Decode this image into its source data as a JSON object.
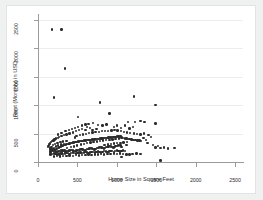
{
  "chart_data": {
    "type": "scatter",
    "title": "",
    "xlabel": "Home Size in Square Feet",
    "ylabel": "Rent (Monthly) in USD",
    "xlim": [
      0,
      2600
    ],
    "ylim": [
      0,
      2600
    ],
    "xticks": [
      0,
      500,
      1000,
      1500,
      2000,
      2500
    ],
    "yticks": [
      0,
      500,
      1000,
      1500,
      2000,
      2500
    ],
    "xtick_labels": [
      "0",
      "500",
      "1000",
      "1500",
      "2000",
      "2500"
    ],
    "ytick_labels": [
      "0",
      "500",
      "1000",
      "1500",
      "2000",
      "2500"
    ],
    "grid": "horizontal",
    "legend": "none",
    "marker": {
      "shape": "circle",
      "color": "#2c2c2c",
      "size": 2.4
    },
    "background": "#ffffff",
    "figure_background": "#eff0f0",
    "points": [
      [
        178,
        2330
      ],
      [
        300,
        2330
      ],
      [
        345,
        1640
      ],
      [
        205,
        1135
      ],
      [
        790,
        1045
      ],
      [
        1215,
        1150
      ],
      [
        1490,
        1000
      ],
      [
        505,
        790
      ],
      [
        905,
        850
      ],
      [
        1140,
        700
      ],
      [
        1230,
        700
      ],
      [
        1300,
        720
      ],
      [
        1350,
        705
      ],
      [
        1490,
        675
      ],
      [
        700,
        690
      ],
      [
        760,
        650
      ],
      [
        820,
        640
      ],
      [
        870,
        660
      ],
      [
        960,
        620
      ],
      [
        1000,
        640
      ],
      [
        1050,
        600
      ],
      [
        1100,
        640
      ],
      [
        1160,
        590
      ],
      [
        1205,
        610
      ],
      [
        620,
        620
      ],
      [
        660,
        600
      ],
      [
        560,
        580
      ],
      [
        600,
        560
      ],
      [
        520,
        560
      ],
      [
        480,
        540
      ],
      [
        440,
        520
      ],
      [
        400,
        500
      ],
      [
        360,
        480
      ],
      [
        330,
        470
      ],
      [
        300,
        455
      ],
      [
        270,
        440
      ],
      [
        250,
        420
      ],
      [
        230,
        410
      ],
      [
        210,
        395
      ],
      [
        195,
        380
      ],
      [
        180,
        370
      ],
      [
        165,
        350
      ],
      [
        155,
        335
      ],
      [
        145,
        320
      ],
      [
        140,
        300
      ],
      [
        135,
        285
      ],
      [
        130,
        265
      ],
      [
        150,
        250
      ],
      [
        160,
        240
      ],
      [
        175,
        230
      ],
      [
        190,
        225
      ],
      [
        205,
        220
      ],
      [
        220,
        215
      ],
      [
        235,
        230
      ],
      [
        250,
        245
      ],
      [
        265,
        255
      ],
      [
        280,
        265
      ],
      [
        295,
        275
      ],
      [
        310,
        285
      ],
      [
        325,
        295
      ],
      [
        340,
        300
      ],
      [
        355,
        310
      ],
      [
        370,
        315
      ],
      [
        385,
        320
      ],
      [
        400,
        325
      ],
      [
        415,
        330
      ],
      [
        430,
        335
      ],
      [
        445,
        340
      ],
      [
        460,
        345
      ],
      [
        475,
        350
      ],
      [
        490,
        355
      ],
      [
        505,
        360
      ],
      [
        520,
        360
      ],
      [
        535,
        365
      ],
      [
        550,
        370
      ],
      [
        565,
        372
      ],
      [
        580,
        375
      ],
      [
        595,
        378
      ],
      [
        610,
        380
      ],
      [
        625,
        382
      ],
      [
        640,
        385
      ],
      [
        655,
        388
      ],
      [
        670,
        390
      ],
      [
        685,
        392
      ],
      [
        700,
        395
      ],
      [
        715,
        398
      ],
      [
        730,
        400
      ],
      [
        745,
        402
      ],
      [
        760,
        405
      ],
      [
        775,
        408
      ],
      [
        790,
        410
      ],
      [
        805,
        412
      ],
      [
        820,
        415
      ],
      [
        835,
        418
      ],
      [
        850,
        420
      ],
      [
        865,
        422
      ],
      [
        880,
        425
      ],
      [
        895,
        428
      ],
      [
        910,
        430
      ],
      [
        925,
        432
      ],
      [
        940,
        435
      ],
      [
        955,
        438
      ],
      [
        970,
        440
      ],
      [
        985,
        442
      ],
      [
        1000,
        445
      ],
      [
        1015,
        448
      ],
      [
        1030,
        450
      ],
      [
        1045,
        452
      ],
      [
        1060,
        430
      ],
      [
        1080,
        420
      ],
      [
        1100,
        415
      ],
      [
        1120,
        410
      ],
      [
        1140,
        405
      ],
      [
        1160,
        400
      ],
      [
        1185,
        395
      ],
      [
        1210,
        390
      ],
      [
        1235,
        385
      ],
      [
        1260,
        380
      ],
      [
        1285,
        375
      ],
      [
        1310,
        370
      ],
      [
        1340,
        420
      ],
      [
        1370,
        390
      ],
      [
        1400,
        470
      ],
      [
        1430,
        440
      ],
      [
        1460,
        300
      ],
      [
        1490,
        255
      ],
      [
        1520,
        280
      ],
      [
        1555,
        250
      ],
      [
        1600,
        255
      ],
      [
        1650,
        240
      ],
      [
        1730,
        245
      ],
      [
        160,
        185
      ],
      [
        175,
        190
      ],
      [
        190,
        195
      ],
      [
        205,
        200
      ],
      [
        220,
        180
      ],
      [
        235,
        175
      ],
      [
        250,
        185
      ],
      [
        265,
        190
      ],
      [
        280,
        195
      ],
      [
        295,
        200
      ],
      [
        310,
        205
      ],
      [
        325,
        195
      ],
      [
        340,
        188
      ],
      [
        355,
        182
      ],
      [
        370,
        192
      ],
      [
        385,
        198
      ],
      [
        400,
        205
      ],
      [
        415,
        210
      ],
      [
        430,
        215
      ],
      [
        445,
        205
      ],
      [
        460,
        198
      ],
      [
        475,
        192
      ],
      [
        490,
        200
      ],
      [
        505,
        208
      ],
      [
        520,
        215
      ],
      [
        535,
        222
      ],
      [
        550,
        228
      ],
      [
        565,
        220
      ],
      [
        580,
        212
      ],
      [
        595,
        205
      ],
      [
        610,
        215
      ],
      [
        625,
        225
      ],
      [
        640,
        232
      ],
      [
        655,
        240
      ],
      [
        670,
        245
      ],
      [
        685,
        238
      ],
      [
        700,
        230
      ],
      [
        715,
        222
      ],
      [
        730,
        232
      ],
      [
        745,
        242
      ],
      [
        760,
        250
      ],
      [
        775,
        258
      ],
      [
        790,
        262
      ],
      [
        805,
        255
      ],
      [
        820,
        248
      ],
      [
        835,
        240
      ],
      [
        850,
        250
      ],
      [
        865,
        260
      ],
      [
        880,
        268
      ],
      [
        895,
        275
      ],
      [
        910,
        280
      ],
      [
        925,
        272
      ],
      [
        940,
        265
      ],
      [
        955,
        258
      ],
      [
        970,
        268
      ],
      [
        985,
        278
      ],
      [
        1000,
        285
      ],
      [
        1015,
        292
      ],
      [
        1030,
        298
      ],
      [
        1045,
        290
      ],
      [
        160,
        130
      ],
      [
        180,
        140
      ],
      [
        200,
        150
      ],
      [
        220,
        145
      ],
      [
        240,
        135
      ],
      [
        260,
        145
      ],
      [
        280,
        155
      ],
      [
        300,
        150
      ],
      [
        320,
        140
      ],
      [
        340,
        150
      ],
      [
        360,
        160
      ],
      [
        380,
        155
      ],
      [
        400,
        145
      ],
      [
        420,
        155
      ],
      [
        440,
        165
      ],
      [
        460,
        160
      ],
      [
        480,
        150
      ],
      [
        500,
        160
      ],
      [
        520,
        170
      ],
      [
        540,
        165
      ],
      [
        560,
        155
      ],
      [
        580,
        165
      ],
      [
        600,
        175
      ],
      [
        620,
        170
      ],
      [
        640,
        160
      ],
      [
        660,
        170
      ],
      [
        680,
        180
      ],
      [
        700,
        175
      ],
      [
        720,
        165
      ],
      [
        740,
        175
      ],
      [
        760,
        185
      ],
      [
        780,
        180
      ],
      [
        800,
        170
      ],
      [
        820,
        180
      ],
      [
        840,
        190
      ],
      [
        860,
        185
      ],
      [
        880,
        175
      ],
      [
        900,
        185
      ],
      [
        920,
        195
      ],
      [
        940,
        190
      ],
      [
        960,
        180
      ],
      [
        980,
        190
      ],
      [
        1000,
        200
      ],
      [
        1020,
        195
      ],
      [
        1040,
        185
      ],
      [
        1060,
        195
      ],
      [
        1080,
        200
      ],
      [
        1100,
        190
      ],
      [
        200,
        95
      ],
      [
        240,
        105
      ],
      [
        280,
        100
      ],
      [
        320,
        110
      ],
      [
        360,
        105
      ],
      [
        400,
        115
      ],
      [
        440,
        110
      ],
      [
        480,
        120
      ],
      [
        520,
        115
      ],
      [
        560,
        125
      ],
      [
        600,
        120
      ],
      [
        640,
        130
      ],
      [
        680,
        125
      ],
      [
        720,
        135
      ],
      [
        760,
        130
      ],
      [
        800,
        140
      ],
      [
        840,
        135
      ],
      [
        880,
        145
      ],
      [
        920,
        140
      ],
      [
        960,
        150
      ],
      [
        1000,
        145
      ],
      [
        1040,
        150
      ],
      [
        1080,
        140
      ],
      [
        1120,
        135
      ],
      [
        1160,
        130
      ],
      [
        1200,
        140
      ],
      [
        1250,
        150
      ],
      [
        1300,
        145
      ],
      [
        255,
        480
      ],
      [
        300,
        510
      ],
      [
        350,
        540
      ],
      [
        395,
        560
      ],
      [
        430,
        585
      ],
      [
        470,
        600
      ],
      [
        510,
        620
      ],
      [
        560,
        640
      ],
      [
        600,
        660
      ],
      [
        640,
        670
      ],
      [
        690,
        560
      ],
      [
        740,
        575
      ],
      [
        470,
        430
      ],
      [
        490,
        460
      ],
      [
        530,
        470
      ],
      [
        570,
        485
      ],
      [
        610,
        495
      ],
      [
        650,
        505
      ],
      [
        690,
        515
      ],
      [
        730,
        525
      ],
      [
        770,
        530
      ],
      [
        810,
        540
      ],
      [
        850,
        545
      ],
      [
        890,
        550
      ],
      [
        930,
        555
      ],
      [
        970,
        560
      ],
      [
        1010,
        555
      ],
      [
        1050,
        545
      ],
      [
        1090,
        530
      ],
      [
        1130,
        520
      ],
      [
        1170,
        510
      ],
      [
        1215,
        500
      ],
      [
        1255,
        490
      ],
      [
        1300,
        480
      ],
      [
        1345,
        500
      ],
      [
        1390,
        330
      ],
      [
        1060,
        85
      ],
      [
        1555,
        25
      ],
      [
        1060,
        265
      ],
      [
        1120,
        300
      ],
      [
        275,
        125
      ],
      [
        305,
        165
      ],
      [
        335,
        205
      ],
      [
        365,
        245
      ],
      [
        415,
        260
      ],
      [
        455,
        275
      ],
      [
        495,
        290
      ],
      [
        545,
        305
      ],
      [
        585,
        318
      ],
      [
        625,
        330
      ],
      [
        665,
        342
      ],
      [
        705,
        352
      ],
      [
        745,
        360
      ],
      [
        785,
        368
      ],
      [
        825,
        375
      ],
      [
        865,
        382
      ],
      [
        905,
        390
      ],
      [
        945,
        398
      ],
      [
        985,
        405
      ],
      [
        1025,
        412
      ],
      [
        150,
        210
      ],
      [
        170,
        268
      ],
      [
        190,
        300
      ],
      [
        215,
        318
      ],
      [
        245,
        335
      ],
      [
        285,
        350
      ],
      [
        320,
        362
      ],
      [
        360,
        372
      ],
      [
        150,
        160
      ],
      [
        165,
        175
      ],
      [
        185,
        215
      ],
      [
        200,
        250
      ],
      [
        225,
        270
      ],
      [
        255,
        288
      ],
      [
        290,
        305
      ],
      [
        330,
        320
      ],
      [
        845,
        300
      ],
      [
        885,
        310
      ],
      [
        925,
        318
      ],
      [
        965,
        325
      ],
      [
        1005,
        330
      ],
      [
        1045,
        335
      ],
      [
        1085,
        345
      ],
      [
        1125,
        355
      ]
    ]
  }
}
